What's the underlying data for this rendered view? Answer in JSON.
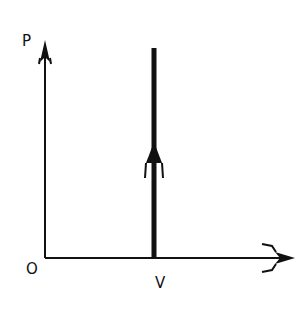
{
  "diagram": {
    "axes": {
      "y_label": "P",
      "x_label_tick": "V",
      "origin_label": "O"
    },
    "process": {
      "type": "isochoric",
      "direction": "up",
      "description": "Vertical line at constant volume V, pressure increasing"
    },
    "colors": {
      "line": "#111111",
      "background": "#ffffff"
    }
  }
}
